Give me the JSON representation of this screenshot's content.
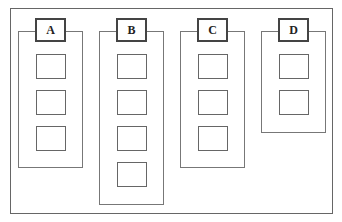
{
  "diagram": {
    "type": "grouped-columns",
    "columns": [
      {
        "label": "A",
        "item_count": 3
      },
      {
        "label": "B",
        "item_count": 4
      },
      {
        "label": "C",
        "item_count": 3
      },
      {
        "label": "D",
        "item_count": 2
      }
    ]
  },
  "colors": {
    "border": "#666666",
    "label_border": "#444444",
    "background": "#ffffff"
  }
}
